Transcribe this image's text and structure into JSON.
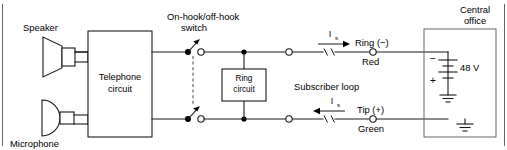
{
  "diagram": {
    "labels": {
      "speaker": "Speaker",
      "microphone": "Microphone",
      "telephone_circuit_line1": "Telephone",
      "telephone_circuit_line2": "circuit",
      "switch_line1": "On-hook/off-hook",
      "switch_line2": "switch",
      "ring_circuit_line1": "Ring",
      "ring_circuit_line2": "circuit",
      "subscriber_loop": "Subscriber loop",
      "central_office_line1": "Central",
      "central_office_line2": "office",
      "ring_terminal": "Ring (−)",
      "ring_wire_color": "Red",
      "tip_terminal": "Tip (+)",
      "tip_wire_color": "Green",
      "battery_voltage": "48 V",
      "battery_negative": "−",
      "battery_positive": "+",
      "current_symbol": "I",
      "current_subscript": "s"
    },
    "colors": {
      "line": "#1a1a1a",
      "frame": "#555555",
      "background": "#ffffff",
      "node": "#000000"
    },
    "components": [
      {
        "name": "speaker",
        "type": "transducer"
      },
      {
        "name": "microphone",
        "type": "transducer"
      },
      {
        "name": "telephone-circuit",
        "type": "block"
      },
      {
        "name": "hook-switch",
        "type": "ganged-spst-switch",
        "poles": 2
      },
      {
        "name": "ring-circuit",
        "type": "block"
      },
      {
        "name": "central-office-battery",
        "type": "dc-source",
        "value": "48 V"
      },
      {
        "name": "ring-line",
        "type": "conductor",
        "polarity": "−",
        "color": "Red"
      },
      {
        "name": "tip-line",
        "type": "conductor",
        "polarity": "+",
        "color": "Green"
      }
    ],
    "currents": [
      {
        "name": "ring-loop-current",
        "symbol": "Is",
        "direction": "right"
      },
      {
        "name": "tip-loop-current",
        "symbol": "Is",
        "direction": "left"
      }
    ]
  }
}
